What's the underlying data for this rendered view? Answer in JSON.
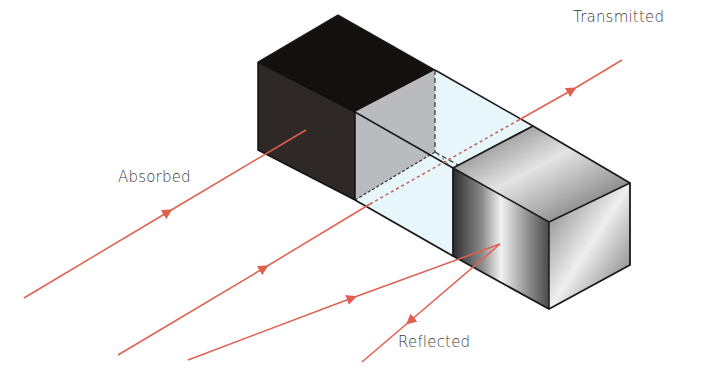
{
  "diagram": {
    "labels": {
      "absorbed": "Absorbed",
      "transmitted": "Transmitted",
      "reflected": "Reflected"
    },
    "blocks": [
      {
        "name": "opaque-block",
        "material": "dark opaque"
      },
      {
        "name": "transparent-block",
        "material": "glass"
      },
      {
        "name": "reflective-block",
        "material": "polished metal"
      }
    ],
    "colors": {
      "ray": "#e0604f",
      "edge": "#1a1a1a",
      "opaque_top": "#141010",
      "opaque_front": "#2e2826",
      "glass": "#e6f6fa",
      "glass_inner": "#b8babd",
      "metal_light": "#e8e8e8",
      "metal_dark": "#3a3a3a"
    }
  }
}
